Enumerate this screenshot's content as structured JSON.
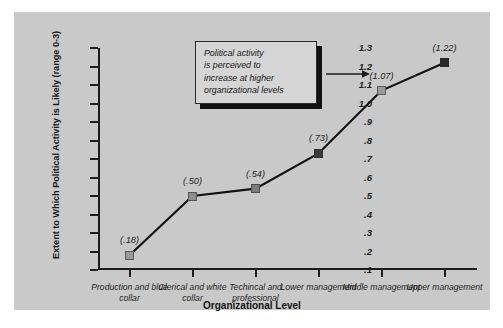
{
  "chart_data": {
    "type": "line",
    "title": "",
    "xlabel": "Organizational Level",
    "ylabel": "Extent to Which Political Activity is Likely (range 0-3)",
    "categories": [
      "Production and blue collar",
      "Clerical and white collar",
      "Techincal and professional",
      "Lower management",
      "Middle management",
      "Upper management"
    ],
    "values": [
      0.18,
      0.5,
      0.54,
      0.73,
      1.07,
      1.22
    ],
    "point_labels": [
      "(.18)",
      "(.50)",
      "(.54)",
      "(.73)",
      "(1.07)",
      "(1.22)"
    ],
    "ylim": [
      0.1,
      1.3
    ],
    "ytick_labels": [
      "1.3",
      "1.2",
      "1.1",
      "1.0",
      ".9",
      ".8",
      ".7",
      ".6",
      ".5",
      ".4",
      ".3",
      ".2",
      ".1"
    ],
    "ytick_values": [
      1.3,
      1.2,
      1.1,
      1.0,
      0.9,
      0.8,
      0.7,
      0.6,
      0.5,
      0.4,
      0.3,
      0.2,
      0.1
    ],
    "grid": false,
    "legend": "none",
    "marker_colors": [
      "#9a9a9a",
      "#8d8d8d",
      "#7c7c7c",
      "#3a3a3a",
      "#9a9a9a",
      "#2a2a2a"
    ],
    "line_color": "#121212",
    "panel_color": "#c9c9c9",
    "axis_color": "#1c1c1c"
  },
  "annotation": {
    "line1": "Political activity",
    "line2": "is perceived to",
    "line3": "increase at higher",
    "line4": "organizational levels",
    "arrow": "arrow-right"
  }
}
